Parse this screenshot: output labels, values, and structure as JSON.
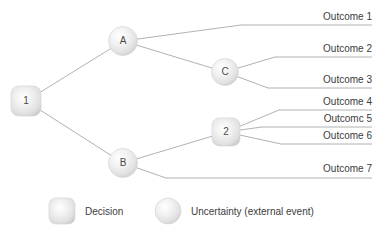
{
  "diagram": {
    "type": "decision-tree",
    "background_color": "#ffffff",
    "edge_color": "#a8a8a8",
    "text_color": "#3c3c3c",
    "nodes": [
      {
        "id": "n1",
        "label": "1",
        "shape": "rounded-square",
        "kind": "decision",
        "x": 26,
        "y": 101,
        "size": 30
      },
      {
        "id": "nA",
        "label": "A",
        "shape": "circle",
        "kind": "uncertainty",
        "x": 123,
        "y": 41,
        "size": 29
      },
      {
        "id": "nB",
        "label": "B",
        "shape": "circle",
        "kind": "uncertainty",
        "x": 123,
        "y": 163,
        "size": 29
      },
      {
        "id": "nC",
        "label": "C",
        "shape": "circle",
        "kind": "uncertainty",
        "x": 225,
        "y": 72,
        "size": 27
      },
      {
        "id": "n2",
        "label": "2",
        "shape": "rounded-square",
        "kind": "decision",
        "x": 226,
        "y": 132,
        "size": 28
      }
    ],
    "outcomes": [
      {
        "id": "o1",
        "label": "Outcome 1",
        "line_y": 25,
        "line_x_start": 241,
        "line_x_end": 372,
        "from": "nA",
        "text_x": 372,
        "text_y": 11
      },
      {
        "id": "o2",
        "label": "Outcome 2",
        "line_y": 57,
        "line_x_start": 275,
        "line_x_end": 372,
        "from": "nC",
        "text_x": 372,
        "text_y": 43
      },
      {
        "id": "o3",
        "label": "Outcome 3",
        "line_y": 88,
        "line_x_start": 268,
        "line_x_end": 372,
        "from": "nC",
        "text_x": 372,
        "text_y": 74
      },
      {
        "id": "o4",
        "label": "Outcome 4",
        "line_y": 110,
        "line_x_start": 279,
        "line_x_end": 372,
        "from": "n2",
        "text_x": 372,
        "text_y": 96
      },
      {
        "id": "o5",
        "label": "Outcomc 5",
        "line_y": 127,
        "line_x_start": 262,
        "line_x_end": 372,
        "from": "n2",
        "text_x": 372,
        "text_y": 113
      },
      {
        "id": "o6",
        "label": "Outcome 6",
        "line_y": 144,
        "line_x_start": 281,
        "line_x_end": 372,
        "from": "n2",
        "text_x": 372,
        "text_y": 130
      },
      {
        "id": "o7",
        "label": "Outcome 7",
        "line_y": 178,
        "line_x_start": 166,
        "line_x_end": 372,
        "from": "nB",
        "text_x": 372,
        "text_y": 163
      }
    ],
    "edges": [
      {
        "id": "e-1-A",
        "from": "n1",
        "to": "nA"
      },
      {
        "id": "e-1-B",
        "from": "n1",
        "to": "nB"
      },
      {
        "id": "e-A-o1",
        "from": "nA",
        "to": "o1"
      },
      {
        "id": "e-A-C",
        "from": "nA",
        "to": "nC"
      },
      {
        "id": "e-C-o2",
        "from": "nC",
        "to": "o2"
      },
      {
        "id": "e-C-o3",
        "from": "nC",
        "to": "o3"
      },
      {
        "id": "e-B-2",
        "from": "nB",
        "to": "n2"
      },
      {
        "id": "e-2-o4",
        "from": "n2",
        "to": "o4"
      },
      {
        "id": "e-2-o5",
        "from": "n2",
        "to": "o5"
      },
      {
        "id": "e-2-o6",
        "from": "n2",
        "to": "o6"
      },
      {
        "id": "e-B-o7",
        "from": "nB",
        "to": "o7"
      }
    ]
  },
  "legend": {
    "items": [
      {
        "id": "legend-decision",
        "label": "Decision",
        "shape": "rounded-square",
        "x": 62,
        "y": 211,
        "size": 26,
        "text_x": 85,
        "text_y": 206
      },
      {
        "id": "legend-uncertainty",
        "label": "Uncertainty (external event)",
        "shape": "circle",
        "x": 168,
        "y": 211,
        "size": 26,
        "text_x": 191,
        "text_y": 206
      }
    ]
  }
}
